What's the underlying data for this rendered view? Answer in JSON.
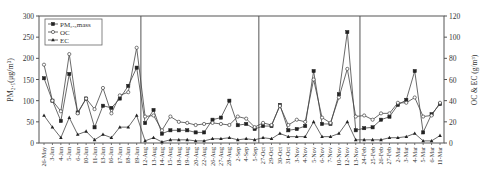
{
  "chart_data": {
    "type": "line",
    "title": "",
    "xlabel": "",
    "ylabel": "PM2.5(ug/m3)",
    "ylabel_display": "PM₂.₅(μg/m³)",
    "y2label": "OC & EC (g/m3)",
    "y2label_display": "OC & EC (g/m³)",
    "ylim": [
      0,
      300
    ],
    "y2lim": [
      0,
      120
    ],
    "yticks": [
      0,
      50,
      100,
      150,
      200,
      250,
      300
    ],
    "y2ticks": [
      0,
      20,
      40,
      60,
      80,
      100,
      120
    ],
    "grid": false,
    "legend_position": "upper-left",
    "section_dividers_after": [
      "19-Jun",
      "5-Sep",
      "13-Nov"
    ],
    "categories": [
      "26-May",
      "3-Jun",
      "4-Jun",
      "5-Jun",
      "6-Jun",
      "10-Jun",
      "11-Jun",
      "13-Jun",
      "16-Jun",
      "17-Jun",
      "18-Jun",
      "19-Jun",
      "12-Aug",
      "13-Aug",
      "14-Aug",
      "15-Aug",
      "18-Aug",
      "19-Aug",
      "20-Aug",
      "22-Aug",
      "26-Aug",
      "27-Aug",
      "28-Aug",
      "2-Sep",
      "4-Sep",
      "5-Sep",
      "27-Oct",
      "29-Oct",
      "30-Oct",
      "31-Oct",
      "3-Nov",
      "4-Nov",
      "5-Nov",
      "6-Nov",
      "7-Nov",
      "10-Nov",
      "12-Nov",
      "13-Nov",
      "24-Feb",
      "25-Feb",
      "26-Feb",
      "27-Feb",
      "2-Mar",
      "3-Mar",
      "4-Mar",
      "5-Mar",
      "6-Mar",
      "11-Mar"
    ],
    "series": [
      {
        "name": "PM2.5 mass",
        "legend_label": "PM₂.₅mass",
        "axis": "left",
        "marker": "square-filled",
        "values": [
          153,
          100,
          52,
          163,
          72,
          105,
          37,
          88,
          83,
          105,
          135,
          178,
          47,
          78,
          22,
          30,
          30,
          30,
          25,
          25,
          55,
          60,
          100,
          42,
          45,
          33,
          40,
          40,
          90,
          30,
          33,
          40,
          170,
          45,
          45,
          115,
          262,
          30,
          35,
          37,
          55,
          62,
          90,
          102,
          170,
          25,
          68,
          92
        ]
      },
      {
        "name": "OC",
        "legend_label": "OC",
        "axis": "right",
        "marker": "circle-open",
        "values": [
          74,
          40,
          30,
          84,
          28,
          42,
          32,
          52,
          28,
          45,
          48,
          90,
          25,
          26,
          12,
          25,
          20,
          19,
          17,
          18,
          19,
          18,
          17,
          25,
          23,
          15,
          19,
          17,
          35,
          17,
          22,
          20,
          60,
          24,
          19,
          43,
          70,
          25,
          26,
          22,
          28,
          28,
          38,
          38,
          43,
          25,
          26,
          38
        ]
      },
      {
        "name": "EC",
        "legend_label": "EC",
        "axis": "right",
        "marker": "triangle-filled",
        "values": [
          26,
          15,
          5,
          24,
          8,
          11,
          3,
          8,
          5,
          15,
          15,
          26,
          2,
          5,
          1,
          3,
          3,
          3,
          2,
          2,
          4,
          4,
          5,
          3,
          4,
          3,
          5,
          4,
          9,
          6,
          6,
          6,
          20,
          6,
          6,
          9,
          20,
          3,
          3,
          3,
          3,
          5,
          5,
          6,
          9,
          2,
          2,
          7
        ]
      }
    ]
  }
}
